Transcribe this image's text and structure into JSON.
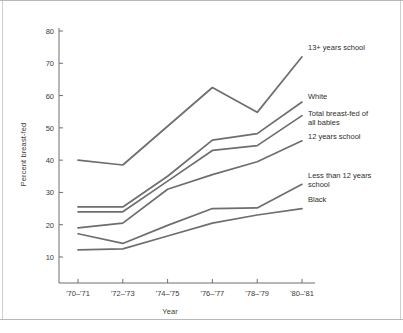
{
  "chart_data": {
    "type": "line",
    "title": "",
    "xlabel": "Year",
    "ylabel": "Percent breast-fed",
    "categories": [
      "'70–'71",
      "'72–'73",
      "'74–'75",
      "'76–'77",
      "'78–'79",
      "'80–'81"
    ],
    "ylim": [
      0,
      85
    ],
    "yticks": [
      10,
      20,
      30,
      40,
      50,
      60,
      70,
      80
    ],
    "ytick_labels": [
      "10",
      "20",
      "30",
      "40",
      "50",
      "60",
      "70",
      "80"
    ],
    "grid": false,
    "legend_position": "right-inline-annotations",
    "line_color": "#6e6e6e",
    "axis_color": "#6e6e6e",
    "text_color": "#2e2e2e",
    "background": "#ffffff",
    "series": [
      {
        "name": "13+ years school",
        "label_lines": "13+ years school",
        "values": [
          40.0,
          38.5,
          50.5,
          62.5,
          54.8,
          72.0
        ]
      },
      {
        "name": "White",
        "label_lines": "White",
        "values": [
          25.5,
          25.5,
          35.0,
          46.2,
          48.2,
          58.0
        ]
      },
      {
        "name": "Total breast-fed of all babies",
        "label_lines": "Total breast-fed of\nall babies",
        "values": [
          24.0,
          24.0,
          33.5,
          43.0,
          44.5,
          53.8
        ]
      },
      {
        "name": "12 years school",
        "label_lines": "12 years school",
        "values": [
          19.0,
          20.5,
          31.0,
          35.5,
          39.5,
          46.0
        ]
      },
      {
        "name": "Less than 12 years school",
        "label_lines": "Less than 12 years\nschool",
        "values": [
          17.2,
          14.2,
          19.8,
          25.0,
          25.2,
          32.5
        ]
      },
      {
        "name": "Black",
        "label_lines": "Black",
        "values": [
          12.2,
          12.5,
          16.5,
          20.5,
          23.0,
          25.0
        ]
      }
    ]
  },
  "figure": {
    "xlabel": "Year",
    "ylabel": "Percent breast-fed"
  }
}
